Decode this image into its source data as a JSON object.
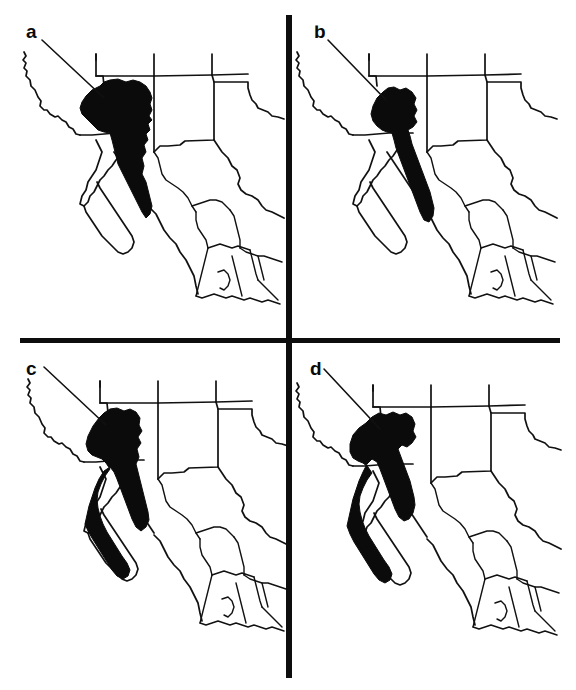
{
  "figure": {
    "type": "multi-panel-distribution-map",
    "panel_count": 4,
    "layout": "2x2",
    "background_color": "#ffffff",
    "line_color": "#111111",
    "range_fill_color": "#0b0b0b",
    "divider_color": "#0d0d0d",
    "region_depicted": "Southwestern United States and Northwestern Mexico",
    "features_shown": [
      "Pacific coastline",
      "Baja California peninsula",
      "Gulf of California",
      "US state boundaries",
      "Mexican state boundaries",
      "US-Mexico international border"
    ]
  },
  "panels": [
    {
      "id": "a",
      "label": "a",
      "position": "top-left",
      "leader_line": true,
      "range_description": "Broad northern range centered on the Arizona-Sonora border, extending south along the Sierra Madre Occidental; widest in the north, tapering southward. Does not include the Baja California peninsula."
    },
    {
      "id": "b",
      "label": "b",
      "position": "top-right",
      "leader_line": true,
      "range_description": "Narrow elongated range along the Sierra Madre Occidental in Sonora and western Chihuahua, with a small northern lobe near the Arizona border. Extends further south than panel a. Does not include the Baja California peninsula."
    },
    {
      "id": "c",
      "label": "c",
      "position": "bottom-left",
      "leader_line": true,
      "range_description": "Range covering the Sierra Madre Occidental plus a long narrow southward extension down the Baja California peninsula to its southern tip."
    },
    {
      "id": "d",
      "label": "d",
      "position": "bottom-right",
      "leader_line": true,
      "range_description": "Largest range: broad block across the Arizona-Sonora borderlands and Sierra Madre Occidental, with a continuous extension down the full length of the Baja California peninsula."
    }
  ]
}
